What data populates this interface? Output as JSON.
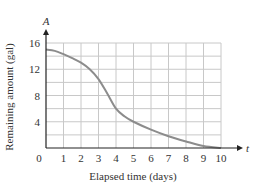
{
  "chart_data": {
    "type": "line",
    "title": "",
    "xlabel": "Elapsed time (days)",
    "ylabel": "Remaining amount (gal)",
    "x_axis_name": "t",
    "y_axis_name": "A",
    "xlim": [
      0,
      10
    ],
    "ylim": [
      0,
      16
    ],
    "x_ticks": [
      0,
      1,
      2,
      3,
      4,
      5,
      6,
      7,
      8,
      9,
      10
    ],
    "y_ticks": [
      4,
      8,
      12,
      16
    ],
    "x_tick_labels": [
      "0",
      "1",
      "2",
      "3",
      "4",
      "5",
      "6",
      "7",
      "8",
      "9",
      "10"
    ],
    "y_tick_labels": [
      "4",
      "8",
      "12",
      "16"
    ],
    "grid": true,
    "grid_y_step": 2,
    "grid_x_step": 1,
    "legend": null,
    "series": [
      {
        "name": "A(t)",
        "color": "#8c8c8c",
        "x": [
          0,
          0.5,
          1,
          1.5,
          2,
          2.5,
          3,
          3.5,
          4,
          4.5,
          5,
          6,
          7,
          8,
          9,
          10
        ],
        "y": [
          15,
          14.8,
          14.3,
          13.7,
          13,
          12,
          10.5,
          8.3,
          6,
          4.8,
          4,
          2.8,
          1.8,
          1,
          0.3,
          0
        ]
      }
    ]
  },
  "colors": {
    "axis": "#222222",
    "grid": "#c8c8c8",
    "curve": "#8c8c8c"
  }
}
